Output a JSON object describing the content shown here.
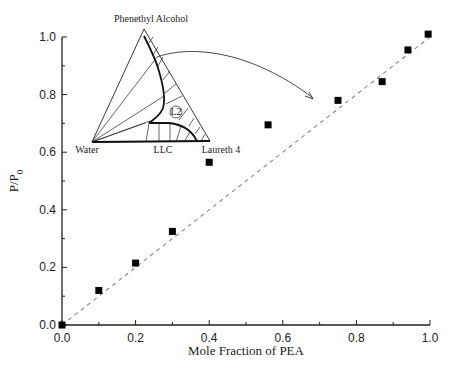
{
  "chart_data": {
    "type": "scatter",
    "title": "",
    "xlabel": "Mole Fraction of PEA",
    "ylabel": "P/P",
    "ylabel_subscript": "0",
    "xlim": [
      0.0,
      1.0
    ],
    "ylim": [
      0.0,
      1.0
    ],
    "x_ticks": [
      "0.0",
      "0.2",
      "0.4",
      "0.6",
      "0.8",
      "1.0"
    ],
    "y_ticks": [
      "0.0",
      "0.2",
      "0.4",
      "0.6",
      "0.8",
      "1.0"
    ],
    "grid": false,
    "legend": null,
    "series": [
      {
        "name": "Measured P/P0",
        "marker": "filled-square",
        "color": "#000000",
        "x": [
          0.0,
          0.1,
          0.2,
          0.3,
          0.4,
          0.56,
          0.75,
          0.87,
          0.94,
          0.995
        ],
        "y": [
          0.0,
          0.12,
          0.215,
          0.325,
          0.565,
          0.695,
          0.78,
          0.845,
          0.955,
          1.01
        ]
      },
      {
        "name": "Ideal (Raoult's law)",
        "style": "dashed",
        "color": "#888888",
        "x": [
          0.0,
          1.0
        ],
        "y": [
          0.0,
          1.0
        ]
      }
    ],
    "inset": {
      "type": "ternary-phase-diagram",
      "vertices": {
        "top": "Phenethyl Alcohol",
        "left": "Water",
        "right": "Laureth 4"
      },
      "regions": [
        "L2",
        "LLC"
      ],
      "annotation": "arrow from L2 region boundary to data near x=0.75"
    }
  },
  "labels": {
    "xlabel": "Mole Fraction of PEA",
    "ylabel_main": "P/P",
    "ylabel_sub": "0",
    "x_ticks": [
      "0.0",
      "0.2",
      "0.4",
      "0.6",
      "0.8",
      "1.0"
    ],
    "y_ticks": [
      "0.0",
      "0.2",
      "0.4",
      "0.6",
      "0.8",
      "1.0"
    ],
    "tern_top": "Phenethyl Alcohol",
    "tern_left": "Water",
    "tern_right": "Laureth 4",
    "tern_llc": "LLC",
    "tern_l2": "L2"
  }
}
